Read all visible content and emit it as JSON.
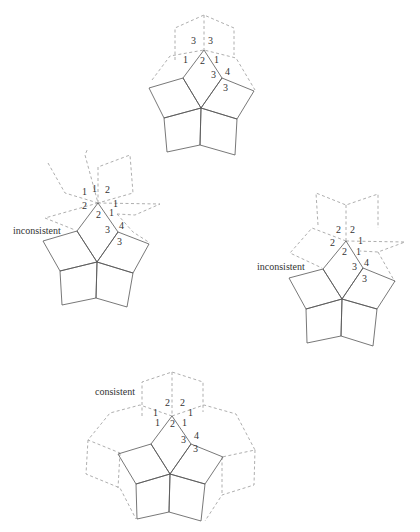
{
  "figures": [
    {
      "id": "top",
      "caption": "",
      "labels": [
        {
          "t": "3",
          "x": 191,
          "y": 44
        },
        {
          "t": "3",
          "x": 208,
          "y": 44
        },
        {
          "t": "1",
          "x": 183,
          "y": 63
        },
        {
          "t": "2",
          "x": 200,
          "y": 64
        },
        {
          "t": "1",
          "x": 214,
          "y": 63
        },
        {
          "t": "3",
          "x": 211,
          "y": 78
        },
        {
          "t": "4",
          "x": 225,
          "y": 75
        },
        {
          "t": "3",
          "x": 223,
          "y": 91
        }
      ]
    },
    {
      "id": "left",
      "caption": "inconsistent",
      "caption_pos": {
        "x": 13,
        "y": 234
      },
      "labels": [
        {
          "t": "1",
          "x": 82,
          "y": 195
        },
        {
          "t": "1",
          "x": 92,
          "y": 192
        },
        {
          "t": "2",
          "x": 105,
          "y": 193
        },
        {
          "t": "2",
          "x": 82,
          "y": 209
        },
        {
          "t": "1",
          "x": 113,
          "y": 207
        },
        {
          "t": "2",
          "x": 96,
          "y": 218
        },
        {
          "t": "1",
          "x": 109,
          "y": 216
        },
        {
          "t": "3",
          "x": 105,
          "y": 233
        },
        {
          "t": "4",
          "x": 119,
          "y": 229
        },
        {
          "t": "3",
          "x": 117,
          "y": 245
        }
      ]
    },
    {
      "id": "right",
      "caption": "inconsistent",
      "caption_pos": {
        "x": 257,
        "y": 270
      },
      "labels": [
        {
          "t": "2",
          "x": 336,
          "y": 233
        },
        {
          "t": "2",
          "x": 350,
          "y": 233
        },
        {
          "t": "2",
          "x": 330,
          "y": 246
        },
        {
          "t": "1",
          "x": 358,
          "y": 244
        },
        {
          "t": "2",
          "x": 342,
          "y": 255
        },
        {
          "t": "1",
          "x": 356,
          "y": 255
        },
        {
          "t": "3",
          "x": 352,
          "y": 270
        },
        {
          "t": "4",
          "x": 364,
          "y": 266
        },
        {
          "t": "3",
          "x": 362,
          "y": 282
        }
      ]
    },
    {
      "id": "bottom",
      "caption": "consistent",
      "caption_pos": {
        "x": 95,
        "y": 395
      },
      "labels": [
        {
          "t": "2",
          "x": 165,
          "y": 406
        },
        {
          "t": "2",
          "x": 180,
          "y": 406
        },
        {
          "t": "1",
          "x": 153,
          "y": 416
        },
        {
          "t": "1",
          "x": 188,
          "y": 416
        },
        {
          "t": "1",
          "x": 155,
          "y": 426
        },
        {
          "t": "2",
          "x": 170,
          "y": 427
        },
        {
          "t": "1",
          "x": 182,
          "y": 426
        },
        {
          "t": "3",
          "x": 181,
          "y": 443
        },
        {
          "t": "4",
          "x": 194,
          "y": 439
        },
        {
          "t": "3",
          "x": 193,
          "y": 452
        }
      ]
    }
  ]
}
